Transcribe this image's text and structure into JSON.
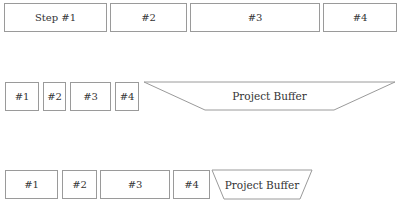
{
  "rows": [
    {
      "name": "original-schedule",
      "steps": [
        {
          "label": "Step #1",
          "x": 4,
          "y": 3,
          "w": 103,
          "h": 29
        },
        {
          "label": "#2",
          "x": 110,
          "y": 3,
          "w": 77,
          "h": 29
        },
        {
          "label": "#3",
          "x": 190,
          "y": 3,
          "w": 130,
          "h": 29
        },
        {
          "label": "#4",
          "x": 323,
          "y": 3,
          "w": 74,
          "h": 29
        }
      ]
    },
    {
      "name": "cut-estimates-with-buffer",
      "steps": [
        {
          "label": "#1",
          "x": 5,
          "y": 82,
          "w": 34,
          "h": 29
        },
        {
          "label": "#2",
          "x": 43,
          "y": 82,
          "w": 23,
          "h": 29
        },
        {
          "label": "#3",
          "x": 70,
          "y": 82,
          "w": 41,
          "h": 29
        },
        {
          "label": "#4",
          "x": 115,
          "y": 82,
          "w": 24,
          "h": 29
        }
      ],
      "buffer": {
        "label": "Project Buffer",
        "points": "144,82 395,82 334,110 205,110",
        "label_x": 205,
        "label_y": 82,
        "label_w": 129,
        "label_h": 28
      }
    },
    {
      "name": "actual-with-consumed-buffer",
      "steps": [
        {
          "label": "#1",
          "x": 5,
          "y": 170,
          "w": 53,
          "h": 29
        },
        {
          "label": "#2",
          "x": 62,
          "y": 170,
          "w": 35,
          "h": 29
        },
        {
          "label": "#3",
          "x": 100,
          "y": 170,
          "w": 70,
          "h": 29
        },
        {
          "label": "#4",
          "x": 173,
          "y": 170,
          "w": 37,
          "h": 29
        }
      ],
      "buffer": {
        "label": "Project Buffer",
        "points": "212,170 312,170 300,199 224,199",
        "label_x": 222,
        "label_y": 170,
        "label_w": 80,
        "label_h": 29
      }
    }
  ],
  "colors": {
    "stroke": "#9a9a9a",
    "text": "#333333",
    "background": "#ffffff"
  }
}
